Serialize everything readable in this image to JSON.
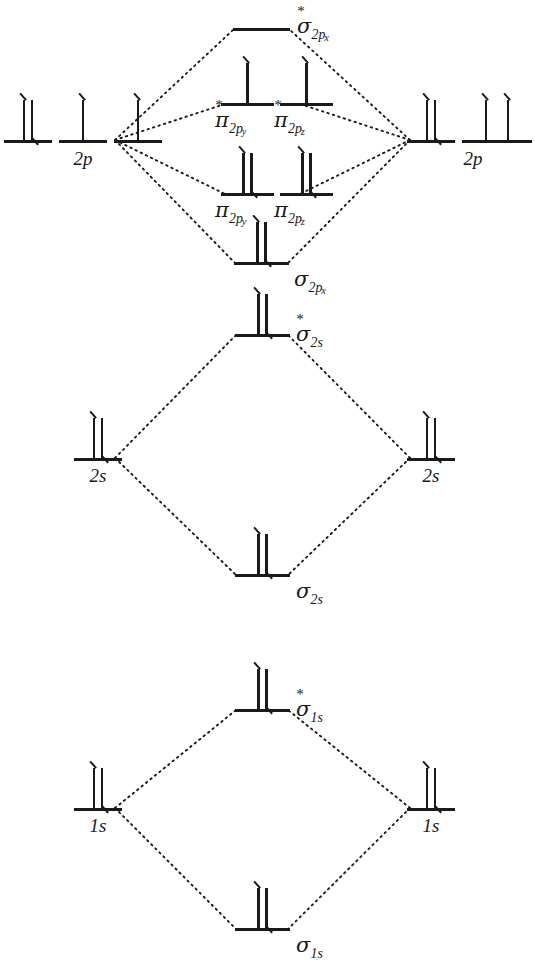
{
  "diagram": {
    "species": "O2",
    "line_color": "#1a1a1a",
    "connector_style": "dotted",
    "background": "#ffffff"
  },
  "blocks": [
    {
      "id": "p-block",
      "atomic_label": "2p",
      "left_atomic": {
        "label": "2p",
        "orbitals": [
          {
            "electrons": [
              "up",
              "down"
            ]
          },
          {
            "electrons": [
              "up"
            ]
          },
          {
            "electrons": [
              "up"
            ]
          }
        ]
      },
      "right_atomic": {
        "label": "2p",
        "orbitals": [
          {
            "electrons": [
              "up",
              "down"
            ]
          },
          {
            "electrons": [
              "up"
            ]
          },
          {
            "electrons": [
              "up"
            ]
          }
        ]
      },
      "molecular_orbitals": [
        {
          "name": "sigma-2px-antibonding",
          "symbol": "σ",
          "star": true,
          "subscript": "2p",
          "subsubscript": "x",
          "electrons": []
        },
        {
          "name": "pi-2py-antibonding",
          "symbol": "π",
          "star": true,
          "subscript": "2p",
          "subsubscript": "y",
          "electrons": [
            "up"
          ]
        },
        {
          "name": "pi-2pz-antibonding",
          "symbol": "π",
          "star": true,
          "subscript": "2p",
          "subsubscript": "z",
          "electrons": [
            "up"
          ]
        },
        {
          "name": "pi-2py-bonding",
          "symbol": "π",
          "star": false,
          "subscript": "2p",
          "subsubscript": "y",
          "electrons": [
            "up",
            "down"
          ]
        },
        {
          "name": "pi-2pz-bonding",
          "symbol": "π",
          "star": false,
          "subscript": "2p",
          "subsubscript": "z",
          "electrons": [
            "up",
            "down"
          ]
        },
        {
          "name": "sigma-2px-bonding",
          "symbol": "σ",
          "star": false,
          "subscript": "2p",
          "subsubscript": "x",
          "electrons": [
            "up",
            "down"
          ]
        }
      ]
    },
    {
      "id": "s2-block",
      "left_atomic": {
        "label": "2s",
        "orbitals": [
          {
            "electrons": [
              "up",
              "down"
            ]
          }
        ]
      },
      "right_atomic": {
        "label": "2s",
        "orbitals": [
          {
            "electrons": [
              "up",
              "down"
            ]
          }
        ]
      },
      "molecular_orbitals": [
        {
          "name": "sigma-2s-antibonding",
          "symbol": "σ",
          "star": true,
          "subscript": "2s",
          "subsubscript": "",
          "electrons": [
            "up",
            "down"
          ]
        },
        {
          "name": "sigma-2s-bonding",
          "symbol": "σ",
          "star": false,
          "subscript": "2s",
          "subsubscript": "",
          "electrons": [
            "up",
            "down"
          ]
        }
      ]
    },
    {
      "id": "s1-block",
      "left_atomic": {
        "label": "1s",
        "orbitals": [
          {
            "electrons": [
              "up",
              "down"
            ]
          }
        ]
      },
      "right_atomic": {
        "label": "1s",
        "orbitals": [
          {
            "electrons": [
              "up",
              "down"
            ]
          }
        ]
      },
      "molecular_orbitals": [
        {
          "name": "sigma-1s-antibonding",
          "symbol": "σ",
          "star": true,
          "subscript": "1s",
          "subsubscript": "",
          "electrons": [
            "up",
            "down"
          ]
        },
        {
          "name": "sigma-1s-bonding",
          "symbol": "σ",
          "star": false,
          "subscript": "1s",
          "subsubscript": "",
          "electrons": [
            "up",
            "down"
          ]
        }
      ]
    }
  ],
  "labels": {
    "left_2p": "2p",
    "right_2p": "2p",
    "left_2s": "2s",
    "right_2s": "2s",
    "left_1s": "1s",
    "right_1s": "1s",
    "sigma_2px_star_sym": "σ",
    "sigma_2px_star_sub": "2p",
    "sigma_2px_star_subsub": "x",
    "pi_2py_star_sym": "π",
    "pi_2py_star_sub": "2p",
    "pi_2py_star_subsub": "y",
    "pi_2pz_star_sym": "π",
    "pi_2pz_star_sub": "2p",
    "pi_2pz_star_subsub": "z",
    "pi_2py_sym": "π",
    "pi_2py_sub": "2p",
    "pi_2py_subsub": "y",
    "pi_2pz_sym": "π",
    "pi_2pz_sub": "2p",
    "pi_2pz_subsub": "z",
    "sigma_2px_sym": "σ",
    "sigma_2px_sub": "2p",
    "sigma_2px_subsub": "x",
    "sigma_2s_star_sym": "σ",
    "sigma_2s_star_sub": "2s",
    "sigma_2s_sym": "σ",
    "sigma_2s_sub": "2s",
    "sigma_1s_star_sym": "σ",
    "sigma_1s_star_sub": "1s",
    "sigma_1s_sym": "σ",
    "sigma_1s_sub": "1s",
    "star": "*"
  }
}
